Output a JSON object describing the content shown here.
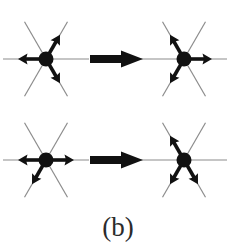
{
  "figure": {
    "caption": "(b)",
    "background_color": "#ffffff",
    "ink_color": "#111111",
    "lattice_line_color": "#8c8c8c",
    "caption_color": "#2b2b2b",
    "panel_count": 4,
    "transition_arrow_count": 2,
    "lattice_arm_count": 6,
    "arrows_per_vertex": 3,
    "geometry": {
      "hub_radius": 7.5,
      "lattice_arm_length": 43,
      "lattice_line_width": 1.2,
      "spin_arrow_length": 22,
      "spin_arrow_width": 3.6,
      "diagonal_angle_deg": 60
    },
    "panels": [
      {
        "id": "top-left",
        "name": "initial-state-upper",
        "row": 0,
        "column": 0,
        "center_x": 46,
        "center_y": 59,
        "arrows": [
          {
            "name": "arrow-up-right",
            "angle_deg": -60,
            "direction": "outward"
          },
          {
            "name": "arrow-left",
            "angle_deg": 180,
            "direction": "outward"
          },
          {
            "name": "arrow-down-right",
            "angle_deg": 60,
            "direction": "outward"
          }
        ]
      },
      {
        "id": "top-right",
        "name": "final-state-upper",
        "row": 0,
        "column": 1,
        "center_x": 184,
        "center_y": 59,
        "arrows": [
          {
            "name": "arrow-up-left",
            "angle_deg": -120,
            "direction": "outward"
          },
          {
            "name": "arrow-right",
            "angle_deg": 0,
            "direction": "outward"
          },
          {
            "name": "arrow-down-left",
            "angle_deg": 120,
            "direction": "outward"
          }
        ]
      },
      {
        "id": "bottom-left",
        "name": "initial-state-lower",
        "row": 1,
        "column": 0,
        "center_x": 46,
        "center_y": 160,
        "arrows": [
          {
            "name": "arrow-left",
            "angle_deg": 180,
            "direction": "outward"
          },
          {
            "name": "arrow-right",
            "angle_deg": 0,
            "direction": "outward"
          },
          {
            "name": "arrow-down-left",
            "angle_deg": 120,
            "direction": "outward"
          }
        ]
      },
      {
        "id": "bottom-right",
        "name": "final-state-lower",
        "row": 1,
        "column": 1,
        "center_x": 184,
        "center_y": 160,
        "arrows": [
          {
            "name": "arrow-up-left",
            "angle_deg": -120,
            "direction": "outward"
          },
          {
            "name": "arrow-down-left",
            "angle_deg": 120,
            "direction": "outward"
          },
          {
            "name": "arrow-down-right",
            "angle_deg": 60,
            "direction": "outward"
          }
        ]
      }
    ],
    "transition_arrows": [
      {
        "id": "transition-upper",
        "name": "block-arrow-upper",
        "from_panel": "top-left",
        "to_panel": "top-right",
        "start_x": 90,
        "end_x": 143,
        "center_y": 59,
        "shaft_height": 8,
        "head_half_height": 17,
        "head_length": 22,
        "points_direction": "right"
      },
      {
        "id": "transition-lower",
        "name": "block-arrow-lower",
        "from_panel": "bottom-left",
        "to_panel": "bottom-right",
        "start_x": 90,
        "end_x": 143,
        "center_y": 160,
        "shaft_height": 8,
        "head_half_height": 17,
        "head_length": 22,
        "points_direction": "right"
      }
    ],
    "caption_position": {
      "x": 118,
      "y": 236
    }
  }
}
